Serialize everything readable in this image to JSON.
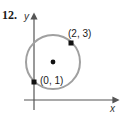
{
  "problem_number": "12.",
  "axes": {
    "x_label": "x",
    "y_label": "y"
  },
  "circle": {
    "center_pixel": [
      53,
      62
    ],
    "radius_pixel": 27,
    "stroke_color": "#a0a0a0"
  },
  "points": [
    {
      "label": "(2, 3)",
      "pixel": [
        71,
        43
      ]
    },
    {
      "label": "(0, 1)",
      "pixel": [
        34,
        82
      ]
    }
  ],
  "center_point": {
    "pixel": [
      53,
      62
    ]
  },
  "colors": {
    "axis": "#555555",
    "point": "#111111"
  }
}
